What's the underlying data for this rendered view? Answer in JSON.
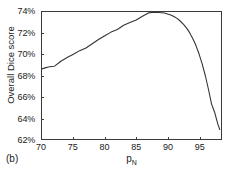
{
  "chart_data": {
    "type": "line",
    "title": "",
    "subtitle": "",
    "panel_label": "(b)",
    "xlabel": "p",
    "xlabel_subscript": "N",
    "ylabel": "Overall Dice score",
    "xlim": [
      70,
      98.5
    ],
    "ylim": [
      62,
      74
    ],
    "grid": false,
    "legend": null,
    "line_color": "#333333",
    "x_ticks": [
      70,
      75,
      80,
      85,
      90,
      95
    ],
    "x_tick_labels": [
      "70",
      "75",
      "80",
      "85",
      "90",
      "95"
    ],
    "y_ticks": [
      62,
      64,
      66,
      68,
      70,
      72,
      74
    ],
    "y_tick_labels": [
      "62%",
      "64%",
      "66%",
      "68%",
      "70%",
      "72%",
      "74%"
    ],
    "series": [
      {
        "name": "Overall Dice score",
        "x": [
          70,
          70.5,
          71,
          71.5,
          72,
          73,
          74,
          75,
          76,
          77,
          78,
          79,
          80,
          81,
          82,
          83,
          84,
          85,
          86,
          87,
          87.5,
          88,
          88.5,
          89,
          89.5,
          90,
          90.5,
          91,
          91.5,
          92,
          92.5,
          93,
          93.5,
          94,
          94.5,
          95,
          95.5,
          96,
          96.5,
          97,
          97.5,
          98,
          98.3
        ],
        "values": [
          68.62,
          68.72,
          68.8,
          68.85,
          68.88,
          69.35,
          69.7,
          70.0,
          70.35,
          70.6,
          71.0,
          71.4,
          71.75,
          72.1,
          72.35,
          72.75,
          73.0,
          73.25,
          73.6,
          73.92,
          73.95,
          73.95,
          73.95,
          73.93,
          73.9,
          73.82,
          73.72,
          73.58,
          73.4,
          73.15,
          72.85,
          72.5,
          72.05,
          71.5,
          70.85,
          70.05,
          69.1,
          68.0,
          66.7,
          65.3,
          64.5,
          63.4,
          62.9
        ]
      }
    ]
  }
}
